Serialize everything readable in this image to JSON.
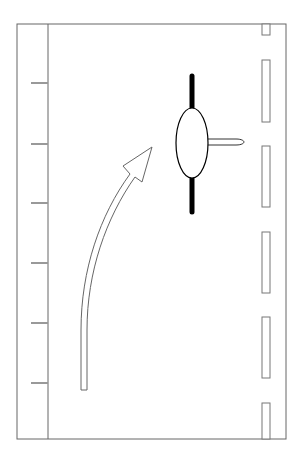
{
  "diagram": {
    "title": "",
    "colors": {
      "stroke": "#555555",
      "tick": "#999999",
      "obstacle": "#000000",
      "background": "#ffffff"
    },
    "frame": {
      "x": 17,
      "y": 24,
      "width": 269,
      "height": 415
    },
    "left_strip_x": 48,
    "left_ticks_y": [
      83,
      144,
      203,
      263,
      323,
      383
    ],
    "right_lane_markers": [
      {
        "y1": 24,
        "y2": 35
      },
      {
        "y1": 60,
        "y2": 122
      },
      {
        "y1": 146,
        "y2": 207
      },
      {
        "y1": 232,
        "y2": 293
      },
      {
        "y1": 317,
        "y2": 378
      },
      {
        "y1": 403,
        "y2": 439
      }
    ],
    "elements": {
      "arrow": "curved-turn-arrow",
      "object": "ellipse-with-vertical-bar-and-pin"
    }
  }
}
